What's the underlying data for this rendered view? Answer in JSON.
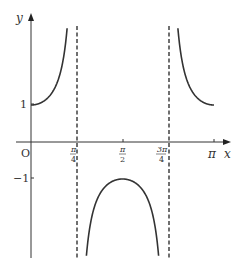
{
  "chart_data": {
    "type": "line",
    "title": "",
    "function": "y = sec(2x)",
    "xlabel": "x",
    "ylabel": "y",
    "origin_label": "O",
    "xlim": [
      0,
      3.1416
    ],
    "ylim": [
      -2.2,
      3.1
    ],
    "grid": false,
    "legend": null,
    "x_ticks": [
      {
        "value": 0.7854,
        "label_num": "π",
        "label_den": "4"
      },
      {
        "value": 1.5708,
        "label_num": "π",
        "label_den": "2"
      },
      {
        "value": 2.3562,
        "label_num": "3π",
        "label_den": "4"
      },
      {
        "value": 3.1416,
        "label": "π"
      }
    ],
    "y_ticks": [
      {
        "value": 1,
        "label": "1"
      },
      {
        "value": -1,
        "label": "−1"
      }
    ],
    "asymptotes": [
      0.7854,
      2.3562
    ],
    "series": [
      {
        "name": "branch-1",
        "x_range": [
          0,
          0.7854
        ],
        "points": [
          [
            0,
            1
          ],
          [
            0.4,
            1.43
          ],
          [
            0.6,
            2.74
          ]
        ]
      },
      {
        "name": "branch-2",
        "x_range": [
          0.7854,
          2.3562
        ],
        "points": [
          [
            0.9,
            -4.6
          ],
          [
            1.2,
            -1.36
          ],
          [
            1.5708,
            -1
          ],
          [
            1.94,
            -1.36
          ],
          [
            2.24,
            -4.6
          ]
        ]
      },
      {
        "name": "branch-3",
        "x_range": [
          2.3562,
          3.1416
        ],
        "points": [
          [
            2.54,
            2.74
          ],
          [
            2.74,
            1.43
          ],
          [
            3.1416,
            1
          ]
        ]
      }
    ],
    "colors": {
      "curve": "#333333",
      "axis": "#333333",
      "asymptote": "#333333"
    }
  }
}
